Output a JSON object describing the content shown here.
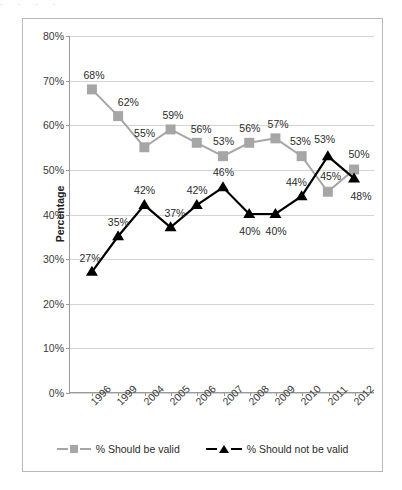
{
  "top_clip_text": "·   ·                    ·                 ·",
  "chart_data": {
    "type": "line",
    "title": "",
    "xlabel": "",
    "ylabel": "Percentage",
    "ylim": [
      0,
      80
    ],
    "ytick_labels": [
      "0%",
      "10%",
      "20%",
      "30%",
      "40%",
      "50%",
      "60%",
      "70%",
      "80%"
    ],
    "ytick_values": [
      0,
      10,
      20,
      30,
      40,
      50,
      60,
      70,
      80
    ],
    "grid": true,
    "legend_position": "bottom-center",
    "categories": [
      "1996",
      "1999",
      "2004",
      "2005",
      "2006",
      "2007",
      "2008",
      "2009",
      "2010",
      "2011",
      "2012"
    ],
    "series": [
      {
        "name": "% Should be valid",
        "color": "#A6A6A6",
        "marker": "square",
        "values": [
          68,
          62,
          55,
          59,
          56,
          53,
          56,
          57,
          53,
          45,
          50
        ],
        "labels": [
          "68%",
          "62%",
          "55%",
          "59%",
          "56%",
          "53%",
          "56%",
          "57%",
          "53%",
          "45%",
          "50%"
        ],
        "label_offsets": [
          {
            "dx": 2,
            "dy": -15
          },
          {
            "dx": 10,
            "dy": -14
          },
          {
            "dx": 0,
            "dy": -15
          },
          {
            "dx": 2,
            "dy": -15
          },
          {
            "dx": 4,
            "dy": -14
          },
          {
            "dx": 0,
            "dy": -15
          },
          {
            "dx": 0,
            "dy": -15
          },
          {
            "dx": 2,
            "dy": -15
          },
          {
            "dx": -2,
            "dy": -15
          },
          {
            "dx": 2,
            "dy": -16
          },
          {
            "dx": 4,
            "dy": -16
          }
        ]
      },
      {
        "name": "% Should not be valid",
        "color": "#000000",
        "marker": "triangle",
        "values": [
          27,
          35,
          42,
          37,
          42,
          46,
          40,
          40,
          44,
          53,
          48
        ],
        "labels": [
          "27%",
          "35%",
          "42%",
          "37%",
          "42%",
          "46%",
          "40%",
          "40%",
          "44%",
          "53%",
          "48%"
        ],
        "label_offsets": [
          {
            "dx": -2,
            "dy": -15
          },
          {
            "dx": 0,
            "dy": -15
          },
          {
            "dx": 0,
            "dy": -16
          },
          {
            "dx": 4,
            "dy": -15
          },
          {
            "dx": 0,
            "dy": -16
          },
          {
            "dx": 0,
            "dy": -16
          },
          {
            "dx": 0,
            "dy": 16
          },
          {
            "dx": 0,
            "dy": 16
          },
          {
            "dx": -6,
            "dy": -15
          },
          {
            "dx": -4,
            "dy": -17
          },
          {
            "dx": 6,
            "dy": 17
          }
        ]
      }
    ],
    "legend": [
      {
        "label": "% Should be valid",
        "color": "#A6A6A6",
        "marker": "square"
      },
      {
        "label": "% Should not be valid",
        "color": "#000000",
        "marker": "triangle"
      }
    ]
  }
}
